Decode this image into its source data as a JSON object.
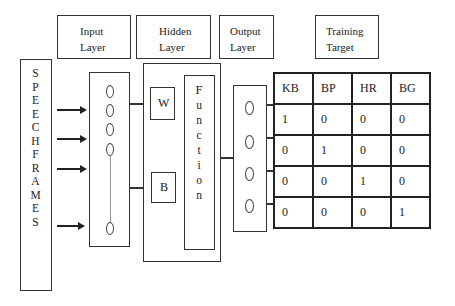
{
  "headers": {
    "input": [
      "Input",
      "Layer"
    ],
    "hidden": [
      "Hidden",
      "Layer"
    ],
    "output": [
      "Output",
      "Layer"
    ],
    "target": [
      "Training",
      "Target"
    ]
  },
  "speech_frames": [
    "S",
    "P",
    "E",
    "E",
    "C",
    "H",
    "F",
    "R",
    "A",
    "M",
    "E",
    "S"
  ],
  "hidden_layer": {
    "weight_label": "W",
    "bias_label": "B",
    "function_letters": [
      "F",
      "u",
      "n",
      "c",
      "t",
      "i",
      "o",
      "n"
    ]
  },
  "training_table": {
    "columns": [
      "KB",
      "BP",
      "HR",
      "BG"
    ],
    "rows": [
      [
        "1",
        "0",
        "0",
        "0"
      ],
      [
        "0",
        "1",
        "0",
        "0"
      ],
      [
        "0",
        "0",
        "1",
        "0"
      ],
      [
        "0",
        "0",
        "0",
        "1"
      ]
    ]
  }
}
